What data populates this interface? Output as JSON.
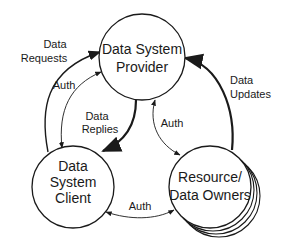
{
  "diagram": {
    "nodes": {
      "provider": {
        "lines": [
          "Data System",
          "Provider"
        ]
      },
      "client": {
        "lines": [
          "Data",
          "System",
          "Client"
        ]
      },
      "resource": {
        "lines": [
          "Resource/",
          "Data Owners"
        ]
      }
    },
    "edges": {
      "data_requests": {
        "lines": [
          "Data",
          "Requests"
        ],
        "from": "client",
        "to": "provider"
      },
      "auth_client_provider": {
        "lines": [
          "Auth"
        ],
        "from": "client",
        "to": "provider",
        "bidirectional": true
      },
      "data_replies": {
        "lines": [
          "Data",
          "Replies"
        ],
        "from": "provider",
        "to": "client"
      },
      "auth_provider_resource": {
        "lines": [
          "Auth"
        ],
        "from": "provider",
        "to": "resource",
        "bidirectional": true
      },
      "data_updates": {
        "lines": [
          "Data",
          "Updates"
        ],
        "from": "resource",
        "to": "provider"
      },
      "auth_client_resource": {
        "lines": [
          "Auth"
        ],
        "from": "client",
        "to": "resource",
        "bidirectional": true
      }
    }
  }
}
